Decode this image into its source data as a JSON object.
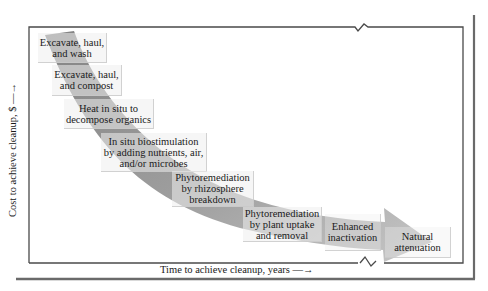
{
  "figure": {
    "y_axis_label": "Cost to achieve cleanup, $ —→",
    "x_axis_label": "Time to achieve cleanup, years —→",
    "arrow_color": "#8f8f8f",
    "frame_color": "#4a4a4a",
    "steps": [
      {
        "line1": "Excavate, haul,",
        "line2": "and wash",
        "line3": ""
      },
      {
        "line1": "Excavate, haul,",
        "line2": "and compost",
        "line3": ""
      },
      {
        "line1": "Heat in situ to",
        "line2": "decompose organics",
        "line3": ""
      },
      {
        "line1": "In situ biostimulation",
        "line2": "by adding nutrients, air,",
        "line3": "and/or microbes"
      },
      {
        "line1": "Phytoremediation",
        "line2": "by rhizosphere",
        "line3": "breakdown"
      },
      {
        "line1": "Phytoremediation",
        "line2": "by plant uptake",
        "line3": "and removal"
      },
      {
        "line1": "Enhanced",
        "line2": "inactivation",
        "line3": ""
      },
      {
        "line1": "Natural",
        "line2": "attenuation",
        "line3": ""
      }
    ]
  }
}
